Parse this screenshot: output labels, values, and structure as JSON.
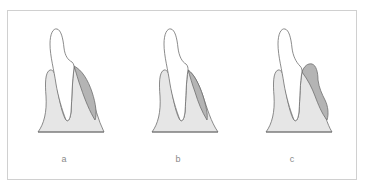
{
  "figure": {
    "panels": [
      {
        "id": "a",
        "label": "a"
      },
      {
        "id": "b",
        "label": "b"
      },
      {
        "id": "c",
        "label": "c"
      }
    ],
    "colors": {
      "frame_border": "#d0d0d0",
      "gum_fill": "#e6e6e6",
      "dark_region_fill": "#b4b4b4",
      "tooth_fill": "#ffffff",
      "outline": "#6e6e6e",
      "label_text": "#8a8a8a"
    }
  }
}
